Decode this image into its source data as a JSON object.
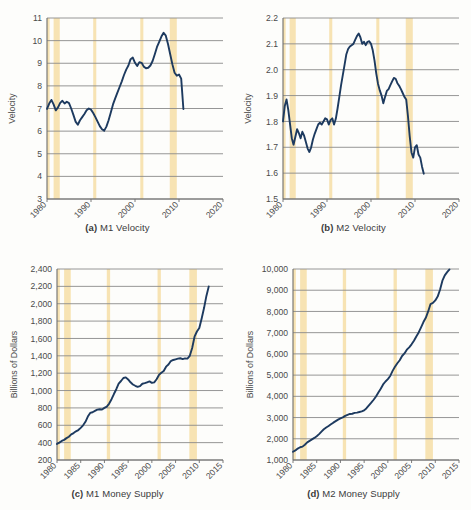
{
  "figure": {
    "title": "",
    "background": "#fdfdfb",
    "line_color": "#1d3a5f",
    "band_color": "#f7e3b3",
    "grid_color": "#8a8a8a",
    "axis_color": "#6e6e6e"
  },
  "panels": {
    "a": {
      "caption_label": "(a)",
      "caption_text": "M1 Velocity",
      "ylabel": "Velocity"
    },
    "b": {
      "caption_label": "(b)",
      "caption_text": "M2 Velocity",
      "ylabel": "Velocity"
    },
    "c": {
      "caption_label": "(c)",
      "caption_text": "M1 Money Supply",
      "ylabel": "Billions of Dollars"
    },
    "d": {
      "caption_label": "(d)",
      "caption_text": "M2 Money Supply",
      "ylabel": "Billions of Dollars"
    }
  },
  "chart_data": [
    {
      "id": "a",
      "type": "line",
      "title": "M1 Velocity",
      "xlabel": "",
      "ylabel": "Velocity",
      "xlim": [
        1980,
        2020
      ],
      "ylim": [
        3,
        11
      ],
      "yticks": [
        3,
        4,
        5,
        6,
        7,
        8,
        9,
        10,
        11
      ],
      "ytick_labels": [
        "3",
        "4",
        "5",
        "6",
        "7",
        "8",
        "9",
        "10",
        "11"
      ],
      "xticks": [
        1980,
        1990,
        2000,
        2010,
        2020
      ],
      "xtick_labels": [
        "1980",
        "1990",
        "2000",
        "2010",
        "2020"
      ],
      "grid": "horizontal",
      "legend": "none",
      "recession_bands": [
        [
          1980.0,
          1980.6
        ],
        [
          1981.5,
          1982.9
        ],
        [
          1990.5,
          1991.2
        ],
        [
          2001.2,
          2001.9
        ],
        [
          2007.9,
          2009.5
        ]
      ],
      "x": [
        1980.0,
        1980.5,
        1981.0,
        1981.5,
        1982.0,
        1982.5,
        1983.0,
        1983.5,
        1984.0,
        1984.5,
        1985.0,
        1985.5,
        1986.0,
        1986.5,
        1987.0,
        1987.5,
        1988.0,
        1988.5,
        1989.0,
        1989.5,
        1990.0,
        1990.5,
        1991.0,
        1991.5,
        1992.0,
        1992.5,
        1993.0,
        1993.5,
        1994.0,
        1994.5,
        1995.0,
        1995.5,
        1996.0,
        1996.5,
        1997.0,
        1997.5,
        1998.0,
        1998.5,
        1999.0,
        1999.5,
        2000.0,
        2000.5,
        2001.0,
        2001.5,
        2002.0,
        2002.5,
        2003.0,
        2003.5,
        2004.0,
        2004.5,
        2005.0,
        2005.5,
        2006.0,
        2006.5,
        2007.0,
        2007.5,
        2008.0,
        2008.5,
        2009.0,
        2009.5,
        2010.0,
        2010.5,
        2011.0
      ],
      "y": [
        6.98,
        7.22,
        7.38,
        7.18,
        6.92,
        7.05,
        7.25,
        7.34,
        7.22,
        7.3,
        7.24,
        7.0,
        6.72,
        6.42,
        6.28,
        6.48,
        6.62,
        6.76,
        6.92,
        7.0,
        6.95,
        6.8,
        6.62,
        6.42,
        6.22,
        6.08,
        6.02,
        6.2,
        6.48,
        6.82,
        7.18,
        7.45,
        7.7,
        7.95,
        8.2,
        8.48,
        8.72,
        8.9,
        9.18,
        9.25,
        9.02,
        8.88,
        9.05,
        9.02,
        8.85,
        8.78,
        8.8,
        8.9,
        9.1,
        9.4,
        9.72,
        9.95,
        10.18,
        10.35,
        10.22,
        9.85,
        9.4,
        8.95,
        8.58,
        8.45,
        8.5,
        8.32,
        6.98
      ]
    },
    {
      "id": "b",
      "type": "line",
      "title": "M2 Velocity",
      "xlabel": "",
      "ylabel": "Velocity",
      "xlim": [
        1980,
        2020
      ],
      "ylim": [
        1.5,
        2.2
      ],
      "yticks": [
        1.5,
        1.6,
        1.7,
        1.8,
        1.9,
        2.0,
        2.1,
        2.2
      ],
      "ytick_labels": [
        "1.5",
        "1.6",
        "1.7",
        "1.8",
        "1.9",
        "2.0",
        "2.1",
        "2.2"
      ],
      "xticks": [
        1980,
        1990,
        2000,
        2010,
        2020
      ],
      "xtick_labels": [
        "1980",
        "1990",
        "2000",
        "2010",
        "2020"
      ],
      "grid": "horizontal",
      "legend": "none",
      "recession_bands": [
        [
          1980.0,
          1980.6
        ],
        [
          1981.5,
          1982.9
        ],
        [
          1990.5,
          1991.2
        ],
        [
          2001.2,
          2001.9
        ],
        [
          2007.9,
          2009.5
        ]
      ],
      "x": [
        1980.0,
        1980.4,
        1980.8,
        1981.2,
        1981.6,
        1982.0,
        1982.4,
        1982.8,
        1983.2,
        1983.6,
        1984.0,
        1984.4,
        1984.8,
        1985.2,
        1985.6,
        1986.0,
        1986.4,
        1986.8,
        1987.2,
        1987.6,
        1988.0,
        1988.4,
        1988.8,
        1989.2,
        1989.6,
        1990.0,
        1990.4,
        1990.8,
        1991.2,
        1991.6,
        1992.0,
        1992.4,
        1992.8,
        1993.2,
        1993.6,
        1994.0,
        1994.4,
        1994.8,
        1995.2,
        1995.6,
        1996.0,
        1996.4,
        1996.8,
        1997.2,
        1997.6,
        1998.0,
        1998.4,
        1998.8,
        1999.2,
        1999.6,
        2000.0,
        2000.4,
        2000.8,
        2001.2,
        2001.6,
        2002.0,
        2002.4,
        2002.8,
        2003.2,
        2003.6,
        2004.0,
        2004.4,
        2004.8,
        2005.2,
        2005.6,
        2006.0,
        2006.4,
        2006.8,
        2007.2,
        2007.6,
        2008.0,
        2008.4,
        2008.8,
        2009.2,
        2009.6,
        2010.0,
        2010.4,
        2010.8,
        2011.2,
        2011.6,
        2012.0
      ],
      "y": [
        1.8,
        1.86,
        1.885,
        1.845,
        1.79,
        1.735,
        1.71,
        1.74,
        1.77,
        1.755,
        1.735,
        1.76,
        1.745,
        1.72,
        1.695,
        1.682,
        1.7,
        1.73,
        1.752,
        1.77,
        1.788,
        1.795,
        1.788,
        1.8,
        1.812,
        1.808,
        1.788,
        1.805,
        1.812,
        1.788,
        1.81,
        1.85,
        1.895,
        1.94,
        1.98,
        2.02,
        2.06,
        2.08,
        2.09,
        2.095,
        2.1,
        2.115,
        2.13,
        2.14,
        2.125,
        2.1,
        2.108,
        2.095,
        2.108,
        2.11,
        2.1,
        2.075,
        2.035,
        1.985,
        1.945,
        1.92,
        1.9,
        1.87,
        1.895,
        1.918,
        1.925,
        1.94,
        1.955,
        1.968,
        1.965,
        1.948,
        1.938,
        1.925,
        1.91,
        1.895,
        1.885,
        1.82,
        1.742,
        1.68,
        1.66,
        1.7,
        1.708,
        1.672,
        1.66,
        1.625,
        1.598
      ]
    },
    {
      "id": "c",
      "type": "line",
      "title": "M1 Money Supply",
      "xlabel": "",
      "ylabel": "Billions of Dollars",
      "xlim": [
        1980,
        2015
      ],
      "ylim": [
        200,
        2400
      ],
      "yticks": [
        200,
        400,
        600,
        800,
        1000,
        1200,
        1400,
        1600,
        1800,
        2000,
        2200,
        2400
      ],
      "ytick_labels": [
        "200",
        "400",
        "600",
        "800",
        "1,000",
        "1,200",
        "1,400",
        "1,600",
        "1,800",
        "2,000",
        "2,200",
        "2,400"
      ],
      "xticks": [
        1980,
        1985,
        1990,
        1995,
        2000,
        2005,
        2010,
        2015
      ],
      "xtick_labels": [
        "1980",
        "1985",
        "1990",
        "1995",
        "2000",
        "2005",
        "2010",
        "2015"
      ],
      "grid": "horizontal",
      "legend": "none",
      "recession_bands": [
        [
          1980.0,
          1980.6
        ],
        [
          1981.5,
          1982.9
        ],
        [
          1990.5,
          1991.2
        ],
        [
          2001.2,
          2001.9
        ],
        [
          2007.9,
          2009.5
        ]
      ],
      "x": [
        1980.0,
        1980.5,
        1981.0,
        1981.5,
        1982.0,
        1982.5,
        1983.0,
        1983.5,
        1984.0,
        1984.5,
        1985.0,
        1985.5,
        1986.0,
        1986.5,
        1987.0,
        1987.5,
        1988.0,
        1988.5,
        1989.0,
        1989.5,
        1990.0,
        1990.5,
        1991.0,
        1991.5,
        1992.0,
        1992.5,
        1993.0,
        1993.5,
        1994.0,
        1994.5,
        1995.0,
        1995.5,
        1996.0,
        1996.5,
        1997.0,
        1997.5,
        1998.0,
        1998.5,
        1999.0,
        1999.5,
        2000.0,
        2000.5,
        2001.0,
        2001.5,
        2002.0,
        2002.5,
        2003.0,
        2003.5,
        2004.0,
        2004.5,
        2005.0,
        2005.5,
        2006.0,
        2006.5,
        2007.0,
        2007.5,
        2008.0,
        2008.5,
        2009.0,
        2009.5,
        2010.0,
        2010.5,
        2011.0,
        2011.5,
        2012.0
      ],
      "y": [
        385,
        400,
        420,
        432,
        452,
        468,
        495,
        510,
        530,
        545,
        570,
        600,
        640,
        700,
        742,
        750,
        765,
        780,
        785,
        782,
        800,
        815,
        850,
        900,
        960,
        1015,
        1080,
        1110,
        1145,
        1152,
        1128,
        1095,
        1070,
        1055,
        1042,
        1050,
        1078,
        1085,
        1095,
        1105,
        1088,
        1095,
        1130,
        1180,
        1205,
        1225,
        1275,
        1300,
        1340,
        1352,
        1360,
        1368,
        1372,
        1362,
        1370,
        1368,
        1400,
        1490,
        1620,
        1680,
        1720,
        1830,
        1950,
        2090,
        2200
      ]
    },
    {
      "id": "d",
      "type": "line",
      "title": "M2 Money Supply",
      "xlabel": "",
      "ylabel": "Billions of Dollars",
      "xlim": [
        1980,
        2015
      ],
      "ylim": [
        1000,
        10000
      ],
      "yticks": [
        1000,
        2000,
        3000,
        4000,
        5000,
        6000,
        7000,
        8000,
        9000,
        10000
      ],
      "ytick_labels": [
        "1,000",
        "2,000",
        "3,000",
        "4,000",
        "5,000",
        "6,000",
        "7,000",
        "8,000",
        "9,000",
        "10,000"
      ],
      "xticks": [
        1980,
        1985,
        1990,
        1995,
        2000,
        2005,
        2010,
        2015
      ],
      "xtick_labels": [
        "1980",
        "1985",
        "1990",
        "1995",
        "2000",
        "2005",
        "2010",
        "2015"
      ],
      "grid": "horizontal",
      "legend": "none",
      "recession_bands": [
        [
          1980.0,
          1980.6
        ],
        [
          1981.5,
          1982.9
        ],
        [
          1990.5,
          1991.2
        ],
        [
          2001.2,
          2001.9
        ],
        [
          2007.9,
          2009.5
        ]
      ],
      "x": [
        1980.0,
        1980.5,
        1981.0,
        1981.5,
        1982.0,
        1982.5,
        1983.0,
        1983.5,
        1984.0,
        1984.5,
        1985.0,
        1985.5,
        1986.0,
        1986.5,
        1987.0,
        1987.5,
        1988.0,
        1988.5,
        1989.0,
        1989.5,
        1990.0,
        1990.5,
        1991.0,
        1991.5,
        1992.0,
        1992.5,
        1993.0,
        1993.5,
        1994.0,
        1994.5,
        1995.0,
        1995.5,
        1996.0,
        1996.5,
        1997.0,
        1997.5,
        1998.0,
        1998.5,
        1999.0,
        1999.5,
        2000.0,
        2000.5,
        2001.0,
        2001.5,
        2002.0,
        2002.5,
        2003.0,
        2003.5,
        2004.0,
        2004.5,
        2005.0,
        2005.5,
        2006.0,
        2006.5,
        2007.0,
        2007.5,
        2008.0,
        2008.5,
        2009.0,
        2009.5,
        2010.0,
        2010.5,
        2011.0,
        2011.5,
        2012.0,
        2012.5,
        2013.0
      ],
      "y": [
        1390,
        1450,
        1540,
        1600,
        1630,
        1720,
        1830,
        1900,
        1970,
        2040,
        2120,
        2220,
        2340,
        2450,
        2530,
        2600,
        2680,
        2760,
        2830,
        2900,
        2960,
        3010,
        3080,
        3130,
        3170,
        3180,
        3220,
        3230,
        3260,
        3290,
        3340,
        3440,
        3570,
        3700,
        3840,
        3990,
        4180,
        4360,
        4560,
        4700,
        4810,
        4960,
        5200,
        5390,
        5560,
        5700,
        5900,
        6020,
        6200,
        6310,
        6450,
        6620,
        6820,
        7010,
        7250,
        7500,
        7700,
        8000,
        8350,
        8400,
        8520,
        8700,
        9020,
        9450,
        9700,
        9850,
        9980
      ]
    }
  ]
}
